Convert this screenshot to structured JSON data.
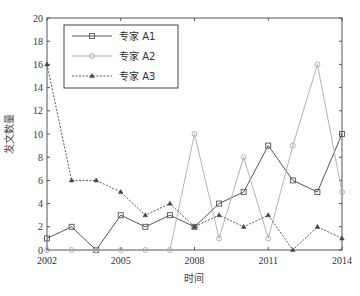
{
  "chart_data": {
    "type": "line",
    "title": "",
    "xlabel": "时间",
    "ylabel": "发文数量",
    "x": [
      2002,
      2003,
      2004,
      2005,
      2006,
      2007,
      2008,
      2009,
      2010,
      2011,
      2012,
      2013,
      2014
    ],
    "xticks": [
      "2002",
      "2005",
      "2008",
      "2011",
      "2014"
    ],
    "xlim": [
      2002,
      2014
    ],
    "yticks": [
      "0",
      "2",
      "4",
      "6",
      "8",
      "10",
      "12",
      "14",
      "16",
      "18",
      "20"
    ],
    "ylim": [
      0,
      20
    ],
    "grid": false,
    "legend_position": "upper-left",
    "series": [
      {
        "name": "专家 A1",
        "marker": "square",
        "line": "solid",
        "color": "#555555",
        "values": [
          1,
          2,
          0,
          3,
          2,
          3,
          2,
          4,
          5,
          9,
          6,
          5,
          10
        ]
      },
      {
        "name": "专家 A2",
        "marker": "circle",
        "line": "solid-light",
        "color": "#999999",
        "values": [
          0,
          0,
          0,
          0,
          0,
          0,
          10,
          1,
          8,
          1,
          9,
          16,
          5
        ]
      },
      {
        "name": "专家 A3",
        "marker": "triangle",
        "line": "dashed",
        "color": "#444444",
        "values": [
          16,
          6,
          6,
          5,
          3,
          4,
          2,
          3,
          2,
          3,
          0,
          2,
          1
        ]
      }
    ]
  },
  "legend": {
    "items": [
      "专家 A1",
      "专家 A2",
      "专家 A3"
    ]
  },
  "axes": {
    "xlabel": "时间",
    "ylabel": "发文数量"
  }
}
